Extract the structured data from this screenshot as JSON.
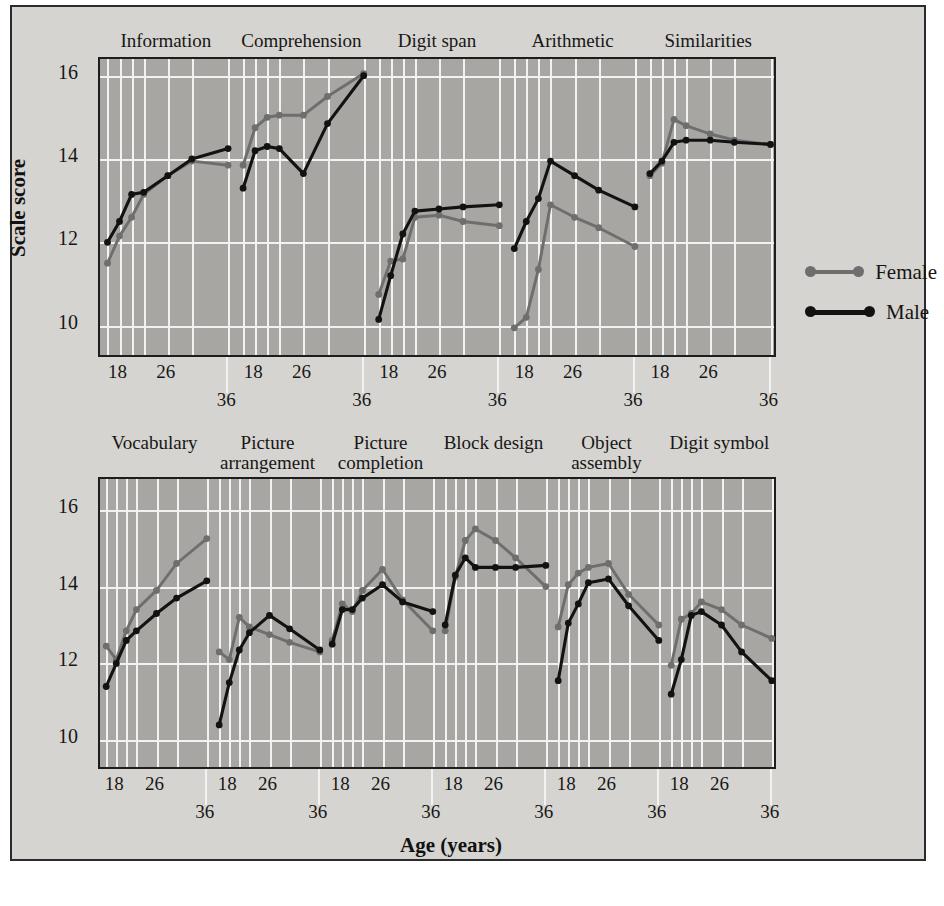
{
  "axes": {
    "ylabel": "Scale score",
    "xlabel": "Age (years)",
    "yticks": [
      "16",
      "14",
      "12",
      "10"
    ],
    "xticks": [
      "18",
      "26",
      "36"
    ]
  },
  "legend": {
    "position": "right",
    "items": [
      {
        "label": "Female",
        "color": "#6e6e6e"
      },
      {
        "label": "Male",
        "color": "#121212"
      }
    ]
  },
  "caption": "",
  "colors": {
    "female": "#6e6e6e",
    "male": "#121212",
    "plot_background": "#a8a6a2",
    "figure_background": "#d6d4d0",
    "grid": "#f2f2f2"
  },
  "chart_data": {
    "type": "line",
    "title": "",
    "xlabel": "Age (years)",
    "ylabel": "Scale score",
    "ylim": [
      9.2,
      16.4
    ],
    "grid": true,
    "legend_position": "right",
    "x": [
      16,
      18,
      20,
      22,
      26,
      30,
      36
    ],
    "xtick_labels": [
      "18",
      "26",
      "36"
    ],
    "panels": [
      {
        "name": "top",
        "ylim": [
          9.2,
          16.4
        ],
        "yticks": [
          16,
          14,
          12,
          10
        ],
        "groups": [
          {
            "label": "Information",
            "series": [
              {
                "name": "Male",
                "values": [
                  12.0,
                  12.5,
                  13.15,
                  13.2,
                  13.6,
                  14.0,
                  14.25
                ]
              },
              {
                "name": "Female",
                "values": [
                  11.5,
                  12.15,
                  12.6,
                  13.15,
                  13.6,
                  13.95,
                  13.85
                ]
              }
            ]
          },
          {
            "label": "Comprehension",
            "series": [
              {
                "name": "Male",
                "values": [
                  13.3,
                  14.2,
                  14.3,
                  14.25,
                  13.65,
                  14.85,
                  16.0
                ]
              },
              {
                "name": "Female",
                "values": [
                  13.85,
                  14.75,
                  15.0,
                  15.05,
                  15.05,
                  15.5,
                  16.05
                ]
              }
            ]
          },
          {
            "label": "Digit span",
            "series": [
              {
                "name": "Male",
                "values": [
                  10.15,
                  11.2,
                  12.2,
                  12.75,
                  12.8,
                  12.85,
                  12.9
                ]
              },
              {
                "name": "Female",
                "values": [
                  10.75,
                  11.55,
                  11.6,
                  12.6,
                  12.65,
                  12.5,
                  12.4
                ]
              }
            ]
          },
          {
            "label": "Arithmetic",
            "series": [
              {
                "name": "Male",
                "values": [
                  11.85,
                  12.5,
                  13.05,
                  13.95,
                  13.6,
                  13.25,
                  12.85
                ]
              },
              {
                "name": "Female",
                "values": [
                  9.95,
                  10.2,
                  11.35,
                  12.9,
                  12.6,
                  12.35,
                  11.9
                ]
              }
            ]
          },
          {
            "label": "Similarities",
            "series": [
              {
                "name": "Male",
                "values": [
                  13.65,
                  13.95,
                  14.4,
                  14.45,
                  14.45,
                  14.4,
                  14.35
                ]
              },
              {
                "name": "Female",
                "values": [
                  13.6,
                  13.9,
                  14.95,
                  14.8,
                  14.6,
                  14.45,
                  14.35
                ]
              }
            ]
          }
        ]
      },
      {
        "name": "bottom",
        "ylim": [
          9.2,
          16.8
        ],
        "yticks": [
          16,
          14,
          12,
          10
        ],
        "groups": [
          {
            "label": "Vocabulary",
            "series": [
              {
                "name": "Male",
                "values": [
                  11.4,
                  12.0,
                  12.6,
                  12.85,
                  13.3,
                  13.7,
                  14.15
                ]
              },
              {
                "name": "Female",
                "values": [
                  12.45,
                  12.1,
                  12.85,
                  13.4,
                  13.9,
                  14.6,
                  15.25
                ]
              }
            ]
          },
          {
            "label": "Picture arrangement",
            "series": [
              {
                "name": "Male",
                "values": [
                  10.4,
                  11.5,
                  12.35,
                  12.8,
                  13.25,
                  12.9,
                  12.35
                ]
              },
              {
                "name": "Female",
                "values": [
                  12.3,
                  12.1,
                  13.2,
                  12.95,
                  12.75,
                  12.55,
                  12.3
                ]
              }
            ]
          },
          {
            "label": "Picture completion",
            "series": [
              {
                "name": "Male",
                "values": [
                  12.5,
                  13.4,
                  13.4,
                  13.7,
                  14.05,
                  13.6,
                  13.35
                ]
              },
              {
                "name": "Female",
                "values": [
                  12.6,
                  13.55,
                  13.35,
                  13.9,
                  14.45,
                  13.65,
                  12.85
                ]
              }
            ]
          },
          {
            "label": "Block design",
            "series": [
              {
                "name": "Male",
                "values": [
                  13.0,
                  14.3,
                  14.75,
                  14.5,
                  14.5,
                  14.5,
                  14.55
                ]
              },
              {
                "name": "Female",
                "values": [
                  12.85,
                  14.25,
                  15.2,
                  15.5,
                  15.2,
                  14.75,
                  14.0
                ]
              }
            ]
          },
          {
            "label": "Object assembly",
            "series": [
              {
                "name": "Male",
                "values": [
                  11.55,
                  13.05,
                  13.55,
                  14.1,
                  14.2,
                  13.5,
                  12.6
                ]
              },
              {
                "name": "Female",
                "values": [
                  12.95,
                  14.05,
                  14.35,
                  14.5,
                  14.6,
                  13.8,
                  13.0
                ]
              }
            ]
          },
          {
            "label": "Digit symbol",
            "series": [
              {
                "name": "Male",
                "values": [
                  11.2,
                  12.1,
                  13.25,
                  13.35,
                  13.0,
                  12.3,
                  11.55
                ]
              },
              {
                "name": "Female",
                "values": [
                  11.95,
                  13.15,
                  13.3,
                  13.6,
                  13.4,
                  13.0,
                  12.65
                ]
              }
            ]
          }
        ]
      }
    ]
  }
}
